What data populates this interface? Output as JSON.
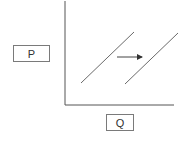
{
  "diagram": {
    "type": "supply-shift",
    "y_axis_label": "P",
    "x_axis_label": "Q",
    "colors": {
      "axis": "#555555",
      "curve": "#6a6a6a",
      "arrow": "#444444"
    },
    "curves": [
      {
        "name": "S1",
        "x1": 81,
        "y1": 83,
        "x2": 134,
        "y2": 32
      },
      {
        "name": "S2",
        "x1": 125,
        "y1": 84,
        "x2": 178,
        "y2": 33
      }
    ],
    "arrow": {
      "direction": "right",
      "x1": 117,
      "y1": 57,
      "x2": 144,
      "y2": 57
    }
  }
}
